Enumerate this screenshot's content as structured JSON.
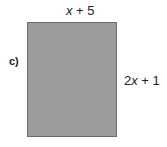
{
  "diagram": {
    "part_label": "c)",
    "shape": "rectangle",
    "fill_color": "#9c9c9c",
    "top_side": {
      "var": "x",
      "rest": " + 5",
      "full": "x + 5"
    },
    "right_side": {
      "coef": "2",
      "var": "x",
      "rest": " + 1",
      "full": "2x + 1"
    }
  }
}
